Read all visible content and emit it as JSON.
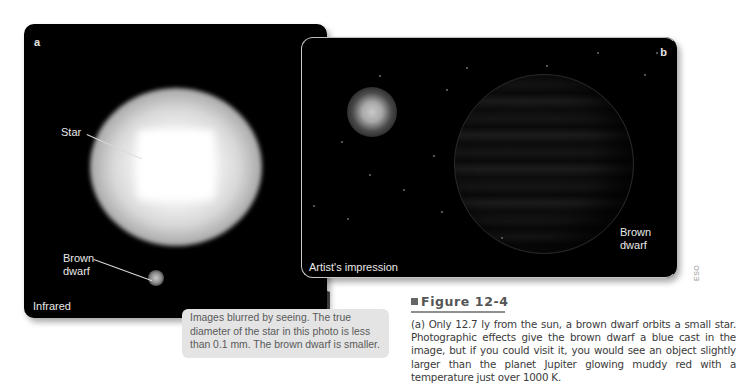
{
  "panel_a": {
    "letter": "a",
    "labels": {
      "star": "Star",
      "brown_dwarf_line1": "Brown",
      "brown_dwarf_line2": "dwarf",
      "mode": "Infrared"
    }
  },
  "panel_b": {
    "letter": "b",
    "labels": {
      "brown_dwarf_line1": "Brown",
      "brown_dwarf_line2": "dwarf",
      "mode": "Artist's impression"
    }
  },
  "callout": {
    "text": "Images blurred by seeing. The true diameter of the star in this photo is less than 0.1 mm. The brown dwarf is smaller."
  },
  "credit": "ESO",
  "figure": {
    "title": "Figure 12-4",
    "caption": "(a) Only 12.7 ly from the sun, a brown dwarf orbits a small star. Photographic effects give the brown dwarf a blue cast in the image, but if you could visit it, you would see an object slightly larger than the planet Jupiter glowing muddy red with a temperature just over 1000 K."
  },
  "colors": {
    "panel_bg": "#000000",
    "callout_bg": "#e4e4e4",
    "wedge": "#3d3d3d",
    "caption_text": "#3a3a3a"
  }
}
